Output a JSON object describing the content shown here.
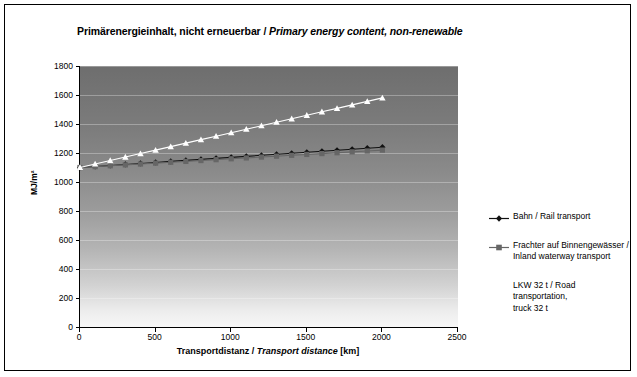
{
  "chart_data": {
    "type": "line",
    "title_de": "Primärenergieinhalt, nicht erneuerbar",
    "title_en": "Primary energy content, non-renewable",
    "title_separator": " / ",
    "xlabel_de": "Transportdistanz",
    "xlabel_en": "Transport distance",
    "xlabel_unit": "[km]",
    "xlabel_separator": " / ",
    "ylabel": "MJ/m²",
    "xlim": [
      0,
      2500
    ],
    "ylim": [
      0,
      1800
    ],
    "xticks": [
      0,
      500,
      1000,
      1500,
      2000,
      2500
    ],
    "yticks": [
      0,
      200,
      400,
      600,
      800,
      1000,
      1200,
      1400,
      1600,
      1800
    ],
    "grid": "horizontal",
    "legend_position": "right",
    "x": [
      0,
      100,
      200,
      300,
      400,
      500,
      600,
      700,
      800,
      900,
      1000,
      1100,
      1200,
      1300,
      1400,
      1500,
      1600,
      1700,
      1800,
      1900,
      2000
    ],
    "series": [
      {
        "name": "Bahn / Rail transport",
        "name_de": "Bahn",
        "name_en": "Rail transport",
        "marker": "diamond",
        "color": "#111111",
        "values": [
          1100,
          1107,
          1114,
          1121,
          1128,
          1135,
          1142,
          1149,
          1156,
          1163,
          1170,
          1177,
          1184,
          1191,
          1198,
          1205,
          1212,
          1219,
          1226,
          1233,
          1240
        ]
      },
      {
        "name": "Frachter auf Binnengewässer / Inland waterway transport",
        "name_de": "Frachter auf Binnengewässer",
        "name_en": "Inland waterway transport",
        "marker": "square",
        "color": "#666666",
        "values": [
          1100,
          1106,
          1112,
          1118,
          1124,
          1130,
          1136,
          1142,
          1148,
          1154,
          1160,
          1166,
          1172,
          1178,
          1184,
          1190,
          1196,
          1202,
          1208,
          1214,
          1220
        ]
      },
      {
        "name": "LKW 32 t / Road transportation, truck 32 t",
        "name_de": "LKW 32 t",
        "name_en": "Road transportation, truck 32 t",
        "marker": "triangle",
        "color": "#ffffff",
        "values": [
          1100,
          1124,
          1148,
          1172,
          1196,
          1220,
          1244,
          1268,
          1292,
          1316,
          1340,
          1364,
          1388,
          1412,
          1436,
          1460,
          1484,
          1508,
          1532,
          1556,
          1580
        ]
      }
    ]
  },
  "legend": {
    "items": [
      {
        "line1": "Bahn / Rail transport",
        "line2": ""
      },
      {
        "line1": "Frachter auf Binnengewässer /",
        "line2": "Inland waterway transport"
      },
      {
        "line1": "LKW 32 t / Road transportation,",
        "line2": "truck 32 t"
      }
    ]
  },
  "colors": {
    "rail": "#111111",
    "barge": "#666666",
    "truck": "#ffffff",
    "frame": "#000000",
    "plot_bg_top": "#6e6e6e",
    "plot_bg_bottom": "#f7f7f7"
  }
}
